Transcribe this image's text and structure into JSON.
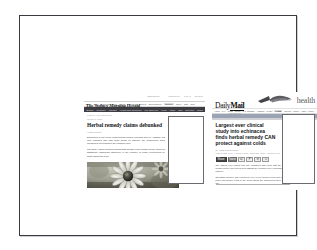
{
  "page": {
    "background_color": "#ffffff",
    "frame_border_color": "#3a3a40"
  },
  "screenshots": [
    {
      "id": "sydney-morning-herald",
      "site_name": "The Sydney Morning Herald",
      "masthead": {
        "title": "The Sydney Morning Herald",
        "tagline": "smh.com.au",
        "utility_links": [
          "Subscribe",
          "Log in",
          "Search"
        ]
      },
      "primary_nav": {
        "items": [
          "News",
          "Sport",
          "Business",
          "World",
          "Politics",
          "Comment",
          "Property",
          "Entertainment",
          "Lifestyle",
          "Travel",
          "Cars",
          "Jobs"
        ],
        "selected": "Lifestyle"
      },
      "secondary_nav": {
        "items": [
          "Beauty",
          "Celebrity",
          "Fashion",
          "Health and Wellbeing",
          "Life and Love",
          "Food",
          "Home",
          "Diet",
          "Exercise",
          "News"
        ],
        "background_color": "#3c3c42"
      },
      "breadcrumb": "Lifestyle  >  Diet and Fitness",
      "date": "October 5, 2012",
      "headline": "Herbal remedy claims debunked",
      "byline": "Health Reporter",
      "paragraphs": [
        "Echinacea is one of the most popular herbal remedies sold in Australia, but new research has cast fresh doubt on whether the supplement does anything at all to shorten the common cold.",
        "The study, which followed participants across a four month period, found no statistically significant difference in the number of colds experienced by those taking the herb.",
        "Researchers said consumers should be wary of marketing claims."
      ],
      "photo_caption": "Echinacea flower",
      "overlay_note": ""
    },
    {
      "id": "daily-mail-health",
      "site_name": "Daily Mail",
      "masthead": {
        "logo_first_word": "Daily",
        "logo_second_word": "Mail",
        "logo_sub": "MailOnline",
        "section_word": "health",
        "graphic": "bird-swoosh-icon"
      },
      "primary_nav": {
        "items": [
          "Home",
          "U.K.",
          "News",
          "Sports",
          "U.S. Showbiz",
          "Australia",
          "Femail",
          "Health",
          "Science",
          "Money",
          "Video",
          "Travel",
          "Fashion Finder"
        ],
        "selected": "Health"
      },
      "headline": "Largest ever clinical study into echinacea finds herbal remedy CAN protect against colds",
      "byline": "By Health Correspondent",
      "timestamp": "PUBLISHED: 09:14, 4 October 2012  |  UPDATED: 11:02, 4 October 2012",
      "share_buttons": [
        {
          "name": "facebook-share-button",
          "label": "Share"
        },
        {
          "name": "twitter-share-button",
          "label": "Tweet"
        },
        {
          "name": "email-share-button",
          "label": "✉"
        },
        {
          "name": "pinterest-share-button",
          "label": "P"
        },
        {
          "name": "linkedin-share-button",
          "label": "in"
        },
        {
          "name": "print-button",
          "label": "⎙"
        }
      ],
      "comments": {
        "icon": "comment-bubble-icon",
        "count": "48"
      },
      "paragraphs": [
        "The largest ever clinical trial into echinacea has found that the popular herbal remedy can help protect against the common cold, researchers have claimed.",
        "Scientists followed 755 volunteers over a four month period and recorded fewer and shorter colds in the group taking the supplement three times a day.",
        "Experts cautioned however that the effect size was modest and that further independent work would be needed to confirm the findings."
      ],
      "overlay_note": ""
    }
  ]
}
